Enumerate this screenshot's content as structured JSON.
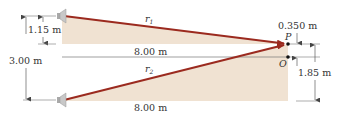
{
  "diagram": {
    "type": "two-speaker interference geometry",
    "colors": {
      "ray": "#9b2a1f",
      "shade": "#f0e2d2",
      "dim_line": "#555555",
      "speaker": "#b8b8b8"
    },
    "rays": [
      {
        "id": "r1",
        "label": "r",
        "sub": "1",
        "from": "upper-speaker",
        "to": "P"
      },
      {
        "id": "r2",
        "label": "r",
        "sub": "2",
        "from": "lower-speaker",
        "to": "P"
      }
    ],
    "points": [
      {
        "id": "P",
        "label": "P"
      },
      {
        "id": "O",
        "label": "O"
      }
    ],
    "dimensions": {
      "speaker_separation": "3.00 m",
      "upper_speaker_offset": "1.15 m",
      "horizontal_upper": "8.00 m",
      "horizontal_lower": "8.00 m",
      "P_above_O": "0.350 m",
      "P_above_lower": "1.85 m"
    },
    "icons": [
      "speaker-icon",
      "speaker-icon"
    ]
  }
}
